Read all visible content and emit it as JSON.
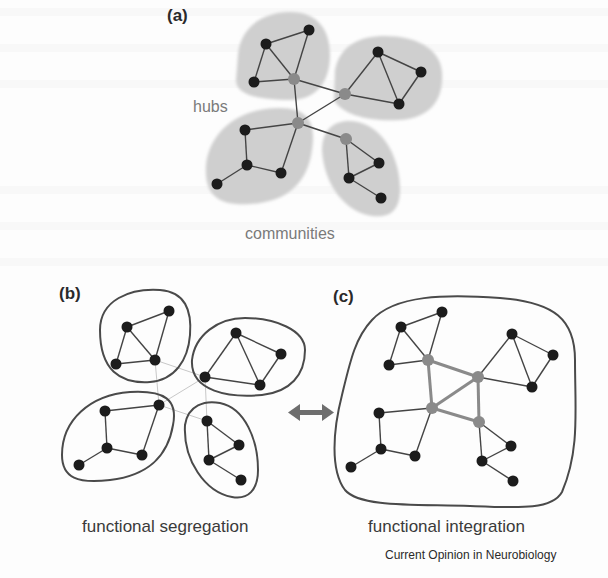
{
  "panels": {
    "a": {
      "label": "(a)",
      "annotations": {
        "hubs": "hubs",
        "communities": "communities"
      }
    },
    "b": {
      "label": "(b)",
      "caption": "functional segregation"
    },
    "c": {
      "label": "(c)",
      "caption": "functional integration"
    }
  },
  "credit": "Current Opinion in Neurobiology",
  "colors": {
    "node": "#1a1a1a",
    "hub": "#8a8a8a",
    "edge": "#444444",
    "community_fill": "#cfcfcf",
    "outline": "#4a4a4a",
    "arrow": "#6e6e6e",
    "faint_edge": "#c8c8c8"
  },
  "arrow": {
    "type": "bidirectional",
    "meaning": "segregation-integration balance"
  }
}
